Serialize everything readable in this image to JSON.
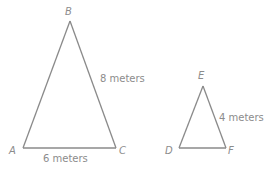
{
  "diagram": {
    "type": "similar-triangles",
    "triangles": [
      {
        "name": "ABC",
        "vertices": [
          "A",
          "B",
          "C"
        ],
        "side_labels": {
          "BC": "8 meters",
          "AC": "6 meters"
        }
      },
      {
        "name": "DEF",
        "vertices": [
          "D",
          "E",
          "F"
        ],
        "side_labels": {
          "EF": "4 meters"
        }
      }
    ]
  },
  "labels": {
    "A": "A",
    "B": "B",
    "C": "C",
    "D": "D",
    "E": "E",
    "F": "F",
    "bc_length": "8 meters",
    "ac_length": "6 meters",
    "ef_length": "4 meters"
  },
  "colors": {
    "line": "#8a8a8a",
    "text": "#8c8c8c",
    "background": "#ffffff"
  }
}
